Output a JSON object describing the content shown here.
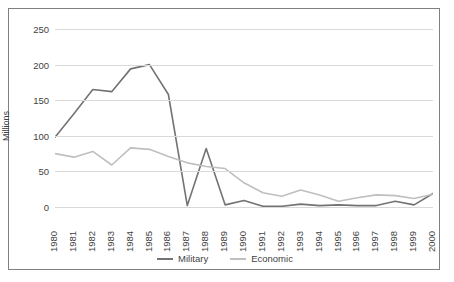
{
  "chart_data": {
    "type": "line",
    "title": "",
    "xlabel": "",
    "ylabel": "Millions",
    "ylim": [
      0,
      250
    ],
    "yticks": [
      0,
      50,
      100,
      150,
      200,
      250
    ],
    "ytick_labels": [
      "0",
      "50",
      "100",
      "150",
      "200",
      "250"
    ],
    "grid": true,
    "legend_position": "bottom",
    "categories": [
      "1980",
      "1981",
      "1982",
      "1983",
      "1984",
      "1985",
      "1986",
      "1987",
      "1988",
      "1989",
      "1990",
      "1991",
      "1992",
      "1993",
      "1994",
      "1995",
      "1996",
      "1997",
      "1998",
      "1999",
      "2000"
    ],
    "series": [
      {
        "name": "Military",
        "color": "#737373",
        "values": [
          98,
          131,
          165,
          162,
          194,
          200,
          158,
          2,
          82,
          3,
          9,
          1,
          1,
          4,
          2,
          3,
          2,
          2,
          8,
          3,
          19
        ]
      },
      {
        "name": "Economic",
        "color": "#bfbfbf",
        "values": [
          75,
          70,
          78,
          59,
          83,
          81,
          71,
          62,
          57,
          54,
          34,
          20,
          15,
          24,
          17,
          8,
          13,
          17,
          16,
          12,
          18
        ]
      }
    ]
  },
  "legend": {
    "items": [
      {
        "label": "Military",
        "color": "#737373"
      },
      {
        "label": "Economic",
        "color": "#bfbfbf"
      }
    ]
  },
  "colors": {
    "military": "#737373",
    "economic": "#bfbfbf",
    "gridline": "#d9d9d9",
    "border": "#808080",
    "text": "#3f3f3f",
    "background": "#ffffff"
  }
}
